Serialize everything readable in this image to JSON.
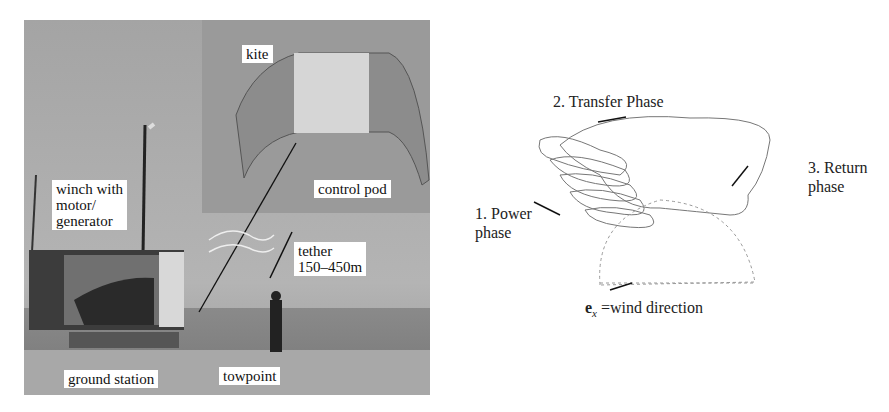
{
  "photo": {
    "labels": {
      "kite": "kite",
      "control_pod": "control pod",
      "winch_line1": "winch with",
      "winch_line2": "motor/",
      "winch_line3": "generator",
      "tether_line1": "tether",
      "tether_line2": "150–450m",
      "ground_station": "ground station",
      "towpoint": "towpoint"
    }
  },
  "diagram": {
    "phase2": "2. Transfer Phase",
    "phase3_line1": "3. Return",
    "phase3_line2": "phase",
    "phase1_line1": "1. Power",
    "phase1_line2": "phase",
    "wind_symbol": "e",
    "wind_sub": "x",
    "wind_text": " =wind direction"
  }
}
